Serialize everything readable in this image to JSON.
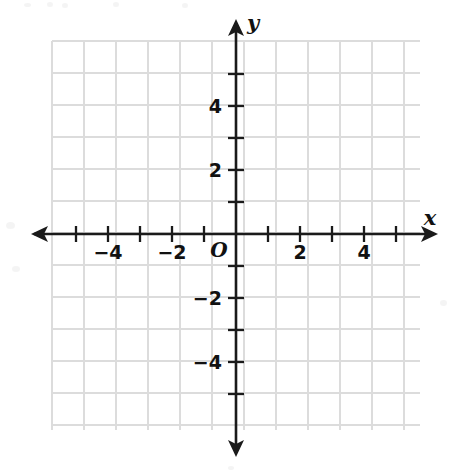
{
  "figure": {
    "kind": "blank-coordinate-plane",
    "background_color": "#ffffff",
    "axis_color": "#1a1a1a",
    "grid_color": "#dcdcdc"
  },
  "axes": {
    "x_axis_label": "x",
    "y_axis_label": "y",
    "origin_label": "O"
  },
  "chart_data": {
    "type": "scatter",
    "title": "",
    "subtitle": "",
    "xlabel": "x",
    "ylabel": "y",
    "origin_label": "O",
    "grid": true,
    "grid_step": 1,
    "legend": null,
    "annotations": [],
    "series": [
      {
        "name": "",
        "x": [],
        "y": []
      }
    ],
    "xlim": [
      -5.75,
      5.75
    ],
    "ylim": [
      -6.0,
      6.0
    ],
    "x_tick_values": [
      -5,
      -4,
      -3,
      -2,
      -1,
      1,
      2,
      3,
      4,
      5
    ],
    "y_tick_values": [
      -5,
      -4,
      -3,
      -2,
      -1,
      1,
      2,
      3,
      4,
      5
    ],
    "x_tick_labels": [
      {
        "value": -4,
        "text": "−4"
      },
      {
        "value": -2,
        "text": "−2"
      },
      {
        "value": 2,
        "text": "2"
      },
      {
        "value": 4,
        "text": "4"
      }
    ],
    "y_tick_labels": [
      {
        "value": 4,
        "text": "4"
      },
      {
        "value": 2,
        "text": "2"
      },
      {
        "value": -2,
        "text": "−2"
      },
      {
        "value": -4,
        "text": "−4"
      }
    ],
    "arrows": [
      "x-negative",
      "x-positive",
      "y-positive",
      "y-negative"
    ]
  }
}
